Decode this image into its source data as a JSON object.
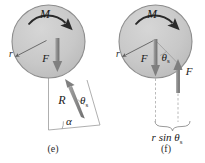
{
  "figure": {
    "caption_e": "(e)",
    "caption_f": "(f)",
    "background_color": "#ffffff",
    "disk_fill_color": "#c9c9c9",
    "disk_stroke_color": "#8a8a8a",
    "arrow_color": "#8c8c8c",
    "arrow_dark_color": "#6f6f6f",
    "text_color": "#1a1a1a",
    "thin_line_color": "#9a9a9a"
  },
  "panel_e": {
    "id": "panel-e",
    "caption": "(e)",
    "disk": {
      "cx": 48.5,
      "cy": 41.5,
      "r": 36.5
    },
    "labels": {
      "moment": "M",
      "force": "F",
      "radius": "r",
      "reaction": "R",
      "angle_alpha": "α",
      "angle_theta": "θ",
      "angle_theta_sub": "s"
    },
    "moment_arrow": {
      "direction": "clockwise",
      "label": "M"
    },
    "force_arrow": {
      "direction": "down",
      "label": "F"
    },
    "reaction_arrow": {
      "direction": "up-left",
      "label": "R"
    }
  },
  "panel_f": {
    "id": "panel-f",
    "caption": "(f)",
    "disk": {
      "cx": 155.5,
      "cy": 41.5,
      "r": 36.5
    },
    "labels": {
      "moment": "M",
      "force_inner": "F",
      "force_outer": "F",
      "radius": "r",
      "angle_theta": "θ",
      "angle_theta_sub": "s",
      "moment_arm_main": "r sin θ",
      "moment_arm_sub": "s"
    },
    "moment_arrow": {
      "direction": "clockwise",
      "label": "M"
    },
    "force_arrow_inner": {
      "direction": "down",
      "label": "F"
    },
    "force_arrow_outer": {
      "direction": "up",
      "label": "F"
    },
    "brace_label": "r sin θs"
  }
}
